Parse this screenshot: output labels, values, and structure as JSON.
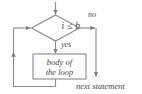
{
  "diagram": {
    "type": "flowchart",
    "canvas": {
      "width": 142,
      "height": 94,
      "background": "#fdfdfd"
    },
    "stroke_color": "#8b8b8b",
    "text_color": "#4a4a4a",
    "nodes": {
      "entry_arrow": {
        "name": "entry-arrow",
        "label": ""
      },
      "condition": {
        "shape": "diamond",
        "text": "i ≤ b",
        "cx": 55,
        "cy": 28,
        "w": 48,
        "h": 26
      },
      "loop_body": {
        "shape": "rectangle",
        "line1": "body of",
        "line2": "the loop",
        "x": 33,
        "y": 54,
        "w": 53,
        "h": 25
      },
      "next_statement": {
        "shape": "text",
        "text": "next statement",
        "x": 76,
        "y": 82
      }
    },
    "edges": {
      "false_branch": {
        "label": "no",
        "from": "condition",
        "to": "next_statement"
      },
      "true_branch": {
        "label": "yes",
        "from": "condition",
        "to": "loop_body"
      },
      "loop_back": {
        "label": "",
        "from": "loop_body",
        "to": "condition"
      }
    }
  }
}
